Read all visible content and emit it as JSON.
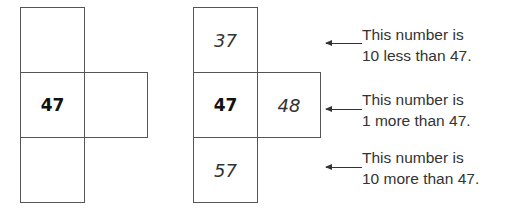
{
  "left_grid": {
    "top": "",
    "center": "47",
    "right": "",
    "bottom": ""
  },
  "right_grid": {
    "top": "37",
    "center": "47",
    "right": "48",
    "bottom": "57"
  },
  "notes": [
    {
      "line1": "This number is",
      "line2": "10 less than 47."
    },
    {
      "line1": "This number is",
      "line2": "1 more than 47."
    },
    {
      "line1": "This number is",
      "line2": "10 more than 47."
    }
  ]
}
